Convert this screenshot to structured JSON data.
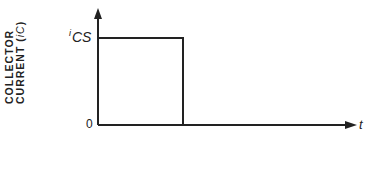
{
  "diagram": {
    "type": "waveform",
    "title": "",
    "y_axis": {
      "label_line1": "COLLECTOR",
      "label_line2_prefix": "CURRENT (",
      "label_symbol": "i",
      "label_symbol_sub": "C",
      "label_line2_suffix": ")",
      "high_level_label_sup": "i",
      "high_level_label": "CS",
      "origin_label": "0"
    },
    "x_axis": {
      "label": "t"
    },
    "waveform": {
      "description": "Rectangular pulse: collector current at level i_CS from t=0, then drops to 0",
      "levels": [
        "i_CS",
        "0"
      ],
      "stroke_color": "#222222"
    }
  }
}
